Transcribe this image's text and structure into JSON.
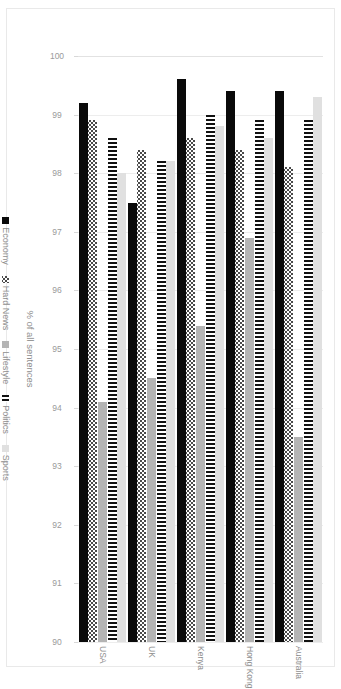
{
  "chart_data": {
    "type": "bar",
    "orientation": "vertical-grouped-rendered-rotated",
    "title": "",
    "subtitle": "",
    "xlabel": "",
    "ylabel": "% of all sentences",
    "ylim": [
      90,
      100
    ],
    "yticks": [
      100,
      99,
      98,
      97,
      96,
      95,
      94,
      93,
      92,
      91,
      90
    ],
    "ytick_labels": [
      "100",
      "99",
      "98",
      "97",
      "96",
      "95",
      "94",
      "93",
      "92",
      "91",
      "90"
    ],
    "grid": true,
    "legend_position": "bottom",
    "baseline": 90,
    "categories": [
      "Australia",
      "Hong Kong",
      "Kenya",
      "UK",
      "USA"
    ],
    "series": [
      {
        "name": "Economy",
        "color": "#0a0a0a",
        "pattern": "solid-black",
        "values": [
          99.4,
          99.4,
          99.6,
          97.5,
          99.2
        ]
      },
      {
        "name": "Hard News",
        "color": "#4a4a4a",
        "pattern": "checker",
        "values": [
          98.1,
          98.4,
          98.6,
          98.4,
          98.9
        ]
      },
      {
        "name": "Lifestyle",
        "color": "#b4b4b4",
        "pattern": "solid-gray",
        "values": [
          93.5,
          96.9,
          95.4,
          94.5,
          94.1
        ]
      },
      {
        "name": "Politics",
        "color": "#111111",
        "pattern": "vertical-stripes",
        "values": [
          98.9,
          98.9,
          99.0,
          98.2,
          98.6
        ]
      },
      {
        "name": "Sports",
        "color": "#e0e0e0",
        "pattern": "solid-light",
        "values": [
          99.3,
          98.6,
          98.8,
          98.2,
          98.0
        ]
      }
    ],
    "legend_entries": [
      "Economy",
      "Hard News",
      "Lifestyle",
      "Politics",
      "Sports"
    ]
  }
}
